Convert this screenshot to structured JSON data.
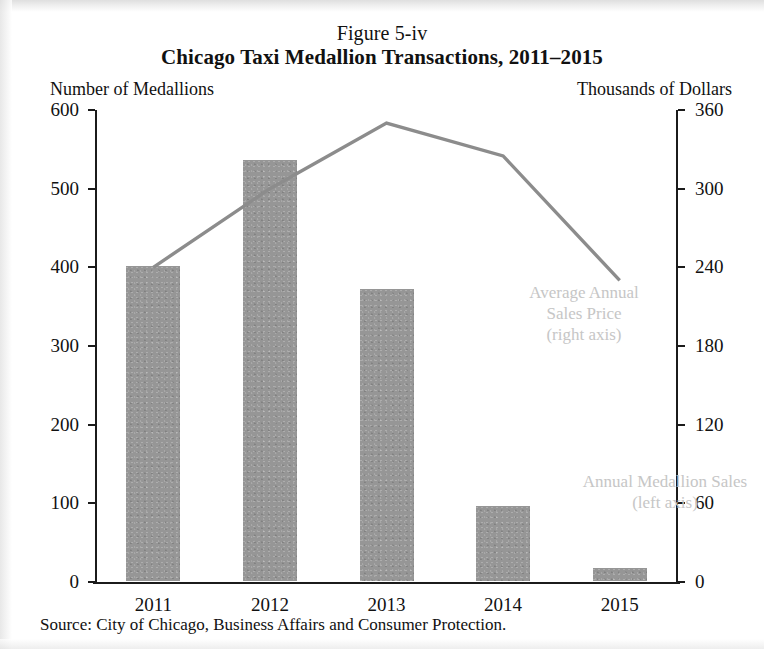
{
  "figure": {
    "number": "Figure 5-iv",
    "title": "Chicago Taxi Medallion Transactions, 2011–2015",
    "left_axis_caption": "Number of Medallions",
    "right_axis_caption": "Thousands of Dollars",
    "source": "Source: City of Chicago, Business Affairs and Consumer Protection."
  },
  "annotations": {
    "line_series": {
      "line1": "Average Annual",
      "line2": "Sales Price",
      "line3": "(right axis)"
    },
    "bar_series": {
      "line1": "Annual Medallion Sales",
      "line2": "(left axis)"
    }
  },
  "colors": {
    "bar_fill": "#969696",
    "line_stroke": "#8c8c8c",
    "axis": "#1b1b1b",
    "annotation_text": "#c6c6c6",
    "background": "#ffffff"
  },
  "chart_data": {
    "type": "bar",
    "title": "Chicago Taxi Medallion Transactions, 2011–2015",
    "subtitle": "Figure 5-iv",
    "xlabel": "",
    "ylabel": "Number of Medallions",
    "y2label": "Thousands of Dollars",
    "categories": [
      "2011",
      "2012",
      "2013",
      "2014",
      "2015"
    ],
    "ylim": [
      0,
      600
    ],
    "y2lim": [
      0,
      360
    ],
    "yticks": [
      0,
      100,
      200,
      300,
      400,
      500,
      600
    ],
    "y2ticks": [
      0,
      60,
      120,
      180,
      240,
      300,
      360
    ],
    "grid": false,
    "legend": "in-plot annotations",
    "series": [
      {
        "name": "Annual Medallion Sales",
        "type": "bar",
        "axis": "left",
        "units": "medallions",
        "values": [
          400,
          535,
          371,
          95,
          16
        ]
      },
      {
        "name": "Average Annual Sales Price",
        "type": "line",
        "axis": "right",
        "units": "thousands of dollars",
        "values": [
          240,
          300,
          350,
          325,
          230
        ]
      }
    ],
    "source": "Source: City of Chicago, Business Affairs and Consumer Protection."
  }
}
